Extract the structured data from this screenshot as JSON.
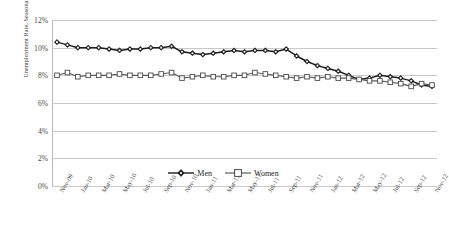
{
  "chart_data": {
    "type": "line",
    "title": "",
    "xlabel": "",
    "ylabel": "Unemployment Rate, Seasonally Adjusted",
    "ylim": [
      0,
      12
    ],
    "ytick_labels": [
      "0%",
      "2%",
      "4%",
      "6%",
      "8%",
      "10%",
      "12%"
    ],
    "ytick_values": [
      0,
      2,
      4,
      6,
      8,
      10,
      12
    ],
    "grid": true,
    "legend_position": "bottom-center",
    "x": [
      "Nov-09",
      "Dec-09",
      "Jan-10",
      "Feb-10",
      "Mar-10",
      "Apr-10",
      "May-10",
      "Jun-10",
      "Jul-10",
      "Aug-10",
      "Sep-10",
      "Oct-10",
      "Nov-10",
      "Dec-10",
      "Jan-11",
      "Feb-11",
      "Mar-11",
      "Apr-11",
      "May-11",
      "Jun-11",
      "Jul-11",
      "Aug-11",
      "Sep-11",
      "Oct-11",
      "Nov-11",
      "Dec-11",
      "Jan-12",
      "Feb-12",
      "Mar-12",
      "Apr-12",
      "May-12",
      "Jun-12",
      "Jul-12",
      "Aug-12",
      "Sep-12",
      "Oct-12",
      "Nov-12"
    ],
    "xtick_labels": [
      "Nov-09",
      "Jan-10",
      "Mar-10",
      "May-10",
      "Jul-10",
      "Sep-10",
      "Nov-10",
      "Jan-11",
      "Mar-11",
      "May-11",
      "Jul-11",
      "Sep-11",
      "Nov-11",
      "Jan-12",
      "Mar-12",
      "May-12",
      "Jul-12",
      "Sep-12",
      "Nov-12"
    ],
    "xtick_every": 2,
    "series": [
      {
        "name": "Men",
        "marker": "diamond-filled",
        "color": "#1d1d1d",
        "values": [
          10.4,
          10.2,
          10.0,
          10.0,
          10.0,
          9.9,
          9.8,
          9.9,
          9.9,
          10.0,
          10.0,
          10.1,
          9.7,
          9.6,
          9.5,
          9.6,
          9.7,
          9.8,
          9.7,
          9.8,
          9.8,
          9.7,
          9.9,
          9.4,
          9.0,
          8.7,
          8.5,
          8.3,
          8.0,
          7.7,
          7.8,
          8.0,
          7.9,
          7.8,
          7.6,
          7.3,
          7.2
        ]
      },
      {
        "name": "Women",
        "marker": "square-open",
        "color": "#5a5a5a",
        "values": [
          8.0,
          8.2,
          7.9,
          8.0,
          8.0,
          8.0,
          8.1,
          8.0,
          8.0,
          8.0,
          8.1,
          8.2,
          7.8,
          7.9,
          8.0,
          7.9,
          7.9,
          8.0,
          8.0,
          8.2,
          8.1,
          8.0,
          7.9,
          7.8,
          7.9,
          7.8,
          7.9,
          7.8,
          7.8,
          7.7,
          7.6,
          7.6,
          7.5,
          7.4,
          7.2,
          7.4,
          7.3
        ]
      }
    ]
  },
  "legend": {
    "items": [
      {
        "label": "Men"
      },
      {
        "label": "Women"
      }
    ]
  }
}
